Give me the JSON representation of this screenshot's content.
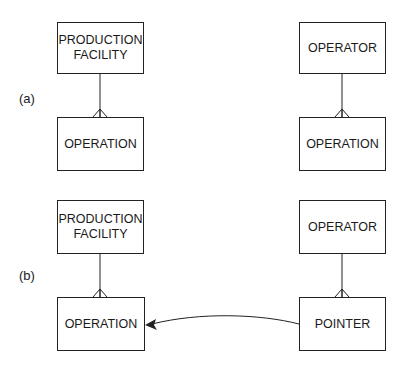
{
  "panels": [
    {
      "label": "(a)",
      "entities": {
        "top_left": "PRODUCTION\nFACILITY",
        "bottom_left": "OPERATION",
        "top_right": "OPERATOR",
        "bottom_right": "OPERATION"
      },
      "relationships": [
        {
          "from": "PRODUCTION FACILITY",
          "to": "OPERATION",
          "cardinality": "one-to-many"
        },
        {
          "from": "OPERATOR",
          "to": "OPERATION",
          "cardinality": "one-to-many"
        }
      ]
    },
    {
      "label": "(b)",
      "entities": {
        "top_left": "PRODUCTION\nFACILITY",
        "bottom_left": "OPERATION",
        "top_right": "OPERATOR",
        "bottom_right": "POINTER"
      },
      "relationships": [
        {
          "from": "PRODUCTION FACILITY",
          "to": "OPERATION",
          "cardinality": "one-to-many"
        },
        {
          "from": "OPERATOR",
          "to": "POINTER",
          "cardinality": "one-to-many"
        },
        {
          "from": "POINTER",
          "to": "OPERATION",
          "type": "arrow"
        }
      ]
    }
  ],
  "colors": {
    "line": "#222222",
    "background": "#ffffff"
  }
}
